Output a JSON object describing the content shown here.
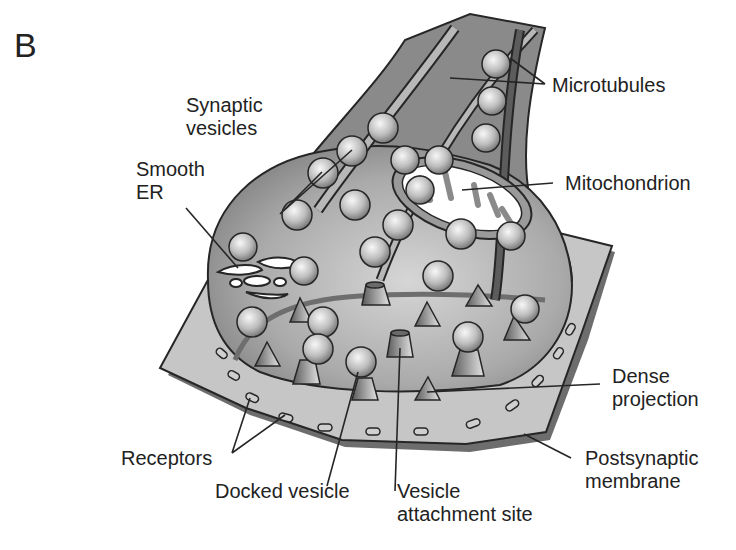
{
  "figure": {
    "panel_letter": "B"
  },
  "labels": {
    "microtubules": "Microtubules",
    "synaptic_vesicles": "Synaptic\nvesicles",
    "smooth_er": "Smooth\nER",
    "mitochondrion": "Mitochondrion",
    "dense_projection": "Dense\nprojection",
    "postsynaptic_membrane": "Postsynaptic\nmembrane",
    "receptors": "Receptors",
    "docked_vesicle": "Docked vesicle",
    "vesicle_attachment_site": "Vesicle\nattachment site"
  },
  "colors": {
    "axon_dark": "#7a7a7a",
    "terminal": "#a9a9a9",
    "membrane": "#c4c4c4",
    "outline": "#262626",
    "vesicle_light": "#f2f2f2",
    "vesicle_dark": "#7d7d7d"
  }
}
